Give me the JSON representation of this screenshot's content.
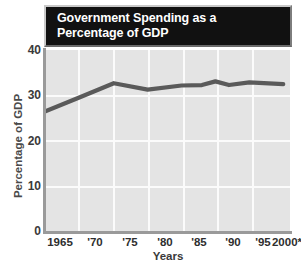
{
  "chart_data": {
    "type": "line",
    "title_line1": "Government Spending as a",
    "title_line2": "Percentage of GDP",
    "xlabel": "Years",
    "ylabel": "Percentage of GDP",
    "x": [
      1965,
      1970,
      1975,
      1980,
      1985,
      1990,
      1995,
      2000
    ],
    "xtick_labels": [
      "1965",
      "'70",
      "'75",
      "'80",
      "'85",
      "'90",
      "'95",
      "2000*"
    ],
    "ytick_labels": [
      "0",
      "10",
      "20",
      "30",
      "40"
    ],
    "ytick_values": [
      0,
      10,
      20,
      30,
      40
    ],
    "ylim": [
      0,
      40
    ],
    "xlim": [
      1965,
      2001
    ],
    "values": [
      26.6,
      29.6,
      32.7,
      31.3,
      32.2,
      32.3,
      32.9,
      32.5
    ],
    "series": [
      {
        "name": "Government spending",
        "values": [
          26.6,
          29.6,
          32.7,
          31.3,
          32.2,
          32.3,
          32.9,
          32.5
        ]
      }
    ],
    "vertices": [
      {
        "year": 1965,
        "value": 26.6
      },
      {
        "year": 1970,
        "value": 29.6
      },
      {
        "year": 1975,
        "value": 32.7
      },
      {
        "year": 1980,
        "value": 31.3
      },
      {
        "year": 1985,
        "value": 32.2
      },
      {
        "year": 1988,
        "value": 32.3
      },
      {
        "year": 1990,
        "value": 33.1
      },
      {
        "year": 1992,
        "value": 32.3
      },
      {
        "year": 1995,
        "value": 32.9
      },
      {
        "year": 2000,
        "value": 32.5
      }
    ],
    "grid": true,
    "grid_color": "#fbfbfb",
    "legend": "none",
    "line_color": "#5a5a5a",
    "plot_background": "#e4e4e4",
    "title_background": "#111111",
    "title_color": "#ffffff",
    "axis_color": "#9a9a9a",
    "footnote_marker": "*"
  }
}
